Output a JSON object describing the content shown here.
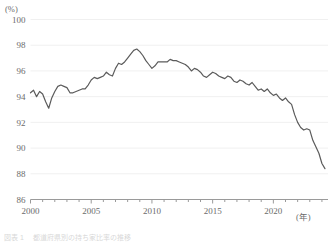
{
  "figure": {
    "y_unit_label": "(%)",
    "x_unit_label": "(年)",
    "source_note": "図表 1 　都道府県別の持ち家比率の推移"
  },
  "chart_data": {
    "type": "line",
    "title": "",
    "subtitle": "",
    "xlabel": "(年)",
    "ylabel": "(%)",
    "ylim": [
      86,
      100
    ],
    "xlim": [
      2000,
      2024.5
    ],
    "ytick_labels": [
      "86",
      "88",
      "90",
      "92",
      "94",
      "96",
      "98",
      "100"
    ],
    "yticks": [
      86,
      88,
      90,
      92,
      94,
      96,
      98,
      100
    ],
    "xtick_labels": [
      "2000",
      "2005",
      "2010",
      "2015",
      "2020"
    ],
    "xticks_major": [
      2000,
      2005,
      2010,
      2015,
      2020
    ],
    "xticks_minor_step": 1,
    "grid": "horizontal",
    "legend": "none",
    "line_color": "#5b5b5b",
    "line_width": 1.2,
    "grid_color": "#f0f0f0",
    "axis_color": "#9a9a9a",
    "series": [
      {
        "name": "比率",
        "x": [
          2000.0,
          2000.25,
          2000.5,
          2000.75,
          2001.0,
          2001.25,
          2001.5,
          2001.75,
          2002.0,
          2002.25,
          2002.5,
          2002.75,
          2003.0,
          2003.25,
          2003.5,
          2003.75,
          2004.0,
          2004.25,
          2004.5,
          2004.75,
          2005.0,
          2005.25,
          2005.5,
          2005.75,
          2006.0,
          2006.25,
          2006.5,
          2006.75,
          2007.0,
          2007.25,
          2007.5,
          2007.75,
          2008.0,
          2008.25,
          2008.5,
          2008.75,
          2009.0,
          2009.25,
          2009.5,
          2009.75,
          2010.0,
          2010.25,
          2010.5,
          2010.75,
          2011.0,
          2011.25,
          2011.5,
          2011.75,
          2012.0,
          2012.25,
          2012.5,
          2012.75,
          2013.0,
          2013.25,
          2013.5,
          2013.75,
          2014.0,
          2014.25,
          2014.5,
          2014.75,
          2015.0,
          2015.25,
          2015.5,
          2015.75,
          2016.0,
          2016.25,
          2016.5,
          2016.75,
          2017.0,
          2017.25,
          2017.5,
          2017.75,
          2018.0,
          2018.25,
          2018.5,
          2018.75,
          2019.0,
          2019.25,
          2019.5,
          2019.75,
          2020.0,
          2020.25,
          2020.5,
          2020.75,
          2021.0,
          2021.25,
          2021.5,
          2021.75,
          2022.0,
          2022.25,
          2022.5,
          2022.75,
          2023.0,
          2023.25,
          2023.5,
          2023.75,
          2024.0,
          2024.25
        ],
        "values": [
          94.3,
          94.5,
          94.0,
          94.4,
          94.2,
          93.6,
          93.1,
          93.9,
          94.4,
          94.8,
          94.9,
          94.8,
          94.7,
          94.3,
          94.3,
          94.4,
          94.5,
          94.6,
          94.6,
          94.9,
          95.3,
          95.5,
          95.4,
          95.5,
          95.6,
          95.9,
          95.7,
          95.6,
          96.2,
          96.6,
          96.5,
          96.7,
          97.0,
          97.3,
          97.6,
          97.7,
          97.5,
          97.2,
          96.8,
          96.5,
          96.2,
          96.4,
          96.7,
          96.7,
          96.7,
          96.7,
          96.9,
          96.8,
          96.8,
          96.7,
          96.6,
          96.5,
          96.3,
          96.0,
          96.2,
          96.1,
          95.9,
          95.6,
          95.5,
          95.7,
          95.9,
          95.8,
          95.6,
          95.5,
          95.4,
          95.6,
          95.5,
          95.2,
          95.1,
          95.3,
          95.2,
          95.0,
          94.9,
          95.1,
          94.8,
          94.5,
          94.6,
          94.4,
          94.6,
          94.3,
          94.1,
          94.2,
          93.9,
          93.7,
          93.9,
          93.6,
          93.4,
          92.6,
          92.0,
          91.6,
          91.4,
          91.5,
          91.4,
          90.6,
          90.1,
          89.6,
          88.8,
          88.4
        ]
      }
    ],
    "annotations": {
      "peak_year": 2008.75,
      "peak_value": 97.7,
      "start_value": 94.3,
      "end_value": 88.4,
      "min_early_dip_value": 93.1
    }
  }
}
